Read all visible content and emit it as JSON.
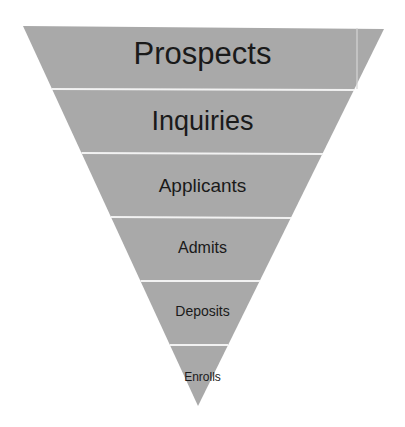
{
  "diagram": {
    "type": "funnel",
    "fill_color": "#a9a9a9",
    "divider_color": "#f2f2f2",
    "text_color": "#1a1a1a",
    "stages": [
      {
        "label": "Prospects",
        "font_size": 31,
        "top": 38
      },
      {
        "label": "Inquiries",
        "font_size": 27,
        "top": 108
      },
      {
        "label": "Applicants",
        "font_size": 19,
        "top": 176
      },
      {
        "label": "Admits",
        "font_size": 16,
        "top": 240
      },
      {
        "label": "Deposits",
        "font_size": 14,
        "top": 304
      },
      {
        "label": "Enrolls",
        "font_size": 12,
        "top": 371
      }
    ]
  }
}
